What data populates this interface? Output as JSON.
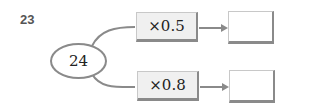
{
  "question": {
    "number": "23"
  },
  "start": {
    "value": "24"
  },
  "branches": [
    {
      "operation": "×0.5",
      "result": ""
    },
    {
      "operation": "×0.8",
      "result": ""
    }
  ],
  "colors": {
    "stroke": "#8a8a8a",
    "box_fill": "#f0f0f0",
    "text": "#222222"
  }
}
